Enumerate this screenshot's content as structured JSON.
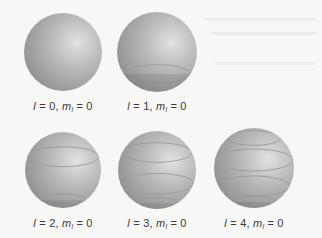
{
  "figure": {
    "type": "spherical-harmonics-m0",
    "panels": [
      {
        "l": "0",
        "ml": "0",
        "l_symbol": "l",
        "ml_symbol": "m",
        "ml_sub": "l",
        "eq": "=",
        "cx": 63,
        "cy": 52,
        "r": 39,
        "bands": [],
        "label_x": 63,
        "label_y": 100
      },
      {
        "l": "1",
        "ml": "0",
        "l_symbol": "l",
        "ml_symbol": "m",
        "ml_sub": "l",
        "eq": "=",
        "cx": 157,
        "cy": 52,
        "r": 40,
        "bands": [
          0.55
        ],
        "label_x": 157,
        "label_y": 100
      },
      {
        "l": "2",
        "ml": "0",
        "l_symbol": "l",
        "ml_symbol": "m",
        "ml_sub": "l",
        "eq": "=",
        "cx": 63,
        "cy": 170,
        "r": 38,
        "bands": [
          -0.35,
          0.8
        ],
        "label_x": 63,
        "label_y": 217
      },
      {
        "l": "3",
        "ml": "0",
        "l_symbol": "l",
        "ml_symbol": "m",
        "ml_sub": "l",
        "eq": "=",
        "cx": 157,
        "cy": 170,
        "r": 39,
        "bands": [
          -0.45,
          0.35,
          0.85
        ],
        "label_x": 157,
        "label_y": 217
      },
      {
        "l": "4",
        "ml": "0",
        "l_symbol": "l",
        "ml_symbol": "m",
        "ml_sub": "l",
        "eq": "=",
        "cx": 254,
        "cy": 168,
        "r": 40,
        "bands": [
          -0.75,
          -0.2,
          0.45,
          0.85
        ],
        "label_x": 254,
        "label_y": 217
      }
    ]
  },
  "colors": {
    "background": "#f7f7f6",
    "sphere_light": "#e2e2e2",
    "sphere_mid": "#b9b9b9",
    "sphere_dark": "#8f8f8f",
    "band_line": "#9a9a9a",
    "label_text": "#3a3a3a"
  }
}
